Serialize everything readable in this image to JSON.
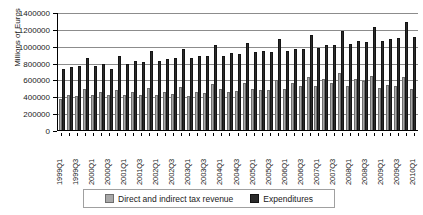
{
  "chart_data": {
    "type": "bar",
    "title": "",
    "xlabel": "",
    "ylabel": "Millions of Euros",
    "ylim": [
      0,
      1400000
    ],
    "ytick_step": 200000,
    "yticks": [
      0,
      200000,
      400000,
      600000,
      800000,
      1000000,
      1200000,
      1400000
    ],
    "ytick_labels": [
      "0",
      "200000",
      "400000",
      "600000",
      "800000",
      "1000000",
      "1200000",
      "1400000"
    ],
    "grid": true,
    "grid_axis": "y",
    "legend_position": "bottom",
    "categories": [
      "1999Q1",
      "1999Q2",
      "1999Q3",
      "1999Q4",
      "2000Q1",
      "2000Q2",
      "2000Q3",
      "2000Q4",
      "2001Q1",
      "2001Q2",
      "2001Q3",
      "2001Q4",
      "2002Q1",
      "2002Q2",
      "2002Q3",
      "2002Q4",
      "2003Q1",
      "2003Q2",
      "2003Q3",
      "2003Q4",
      "2004Q1",
      "2004Q2",
      "2004Q3",
      "2004Q4",
      "2005Q1",
      "2005Q2",
      "2005Q3",
      "2005Q4",
      "2006Q1",
      "2006Q2",
      "2006Q3",
      "2006Q4",
      "2007Q1",
      "2007Q2",
      "2007Q3",
      "2007Q4",
      "2008Q1",
      "2008Q2",
      "2008Q3",
      "2008Q4",
      "2009Q1",
      "2009Q2",
      "2009Q3",
      "2009Q4",
      "2010Q1"
    ],
    "visible_tick_labels": [
      "1999Q1",
      "1999Q3",
      "2000Q1",
      "2000Q3",
      "2001Q1",
      "2001Q3",
      "2002Q1",
      "2002Q3",
      "2003Q1",
      "2003Q3",
      "2004Q1",
      "2004Q3",
      "2005Q1",
      "2005Q3",
      "2006Q1",
      "2006Q3",
      "2007Q1",
      "2007Q3",
      "2008Q1",
      "2008Q3",
      "2009Q1",
      "2009Q3",
      "2010Q1"
    ],
    "series": [
      {
        "name": "Direct and indirect tax revenue",
        "color": "#a8a8a8",
        "values": [
          385000,
          432000,
          415000,
          500000,
          425000,
          460000,
          425000,
          492000,
          425000,
          462000,
          432000,
          508000,
          425000,
          468000,
          440000,
          528000,
          420000,
          462000,
          455000,
          552000,
          500000,
          462000,
          470000,
          570000,
          500000,
          492000,
          488000,
          605000,
          500000,
          572000,
          538000,
          645000,
          535000,
          612000,
          572000,
          692000,
          538000,
          618000,
          588000,
          650000,
          508000,
          548000,
          530000,
          635000,
          500000
        ]
      },
      {
        "name": "Expenditures",
        "color": "#2b2b2b",
        "values": [
          735000,
          762000,
          768000,
          868000,
          772000,
          795000,
          738000,
          888000,
          800000,
          825000,
          822000,
          952000,
          830000,
          858000,
          865000,
          972000,
          862000,
          888000,
          888000,
          1018000,
          888000,
          930000,
          908000,
          1048000,
          932000,
          945000,
          940000,
          1088000,
          952000,
          978000,
          972000,
          1138000,
          982000,
          1022000,
          1018000,
          1188000,
          1028000,
          1068000,
          1055000,
          1238000,
          1068000,
          1092000,
          1098000,
          1288000,
          1112000
        ]
      }
    ]
  },
  "legend": {
    "items": [
      {
        "label": "Direct and indirect tax revenue"
      },
      {
        "label": "Expenditures"
      }
    ]
  }
}
